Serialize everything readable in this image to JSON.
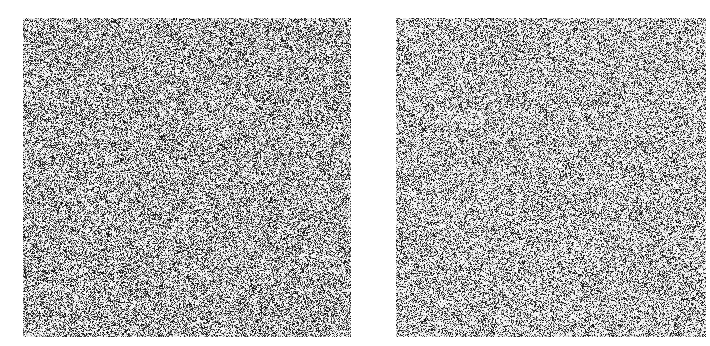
{
  "panels": [
    {
      "id": "left",
      "description": "grayscale random noise texture",
      "seed": 12345,
      "density": 0.46,
      "bg": "#ffffff",
      "fg": "#111111"
    },
    {
      "id": "right",
      "description": "grayscale random noise texture",
      "seed": 67890,
      "density": 0.4,
      "bg": "#ffffff",
      "fg": "#111111"
    }
  ]
}
